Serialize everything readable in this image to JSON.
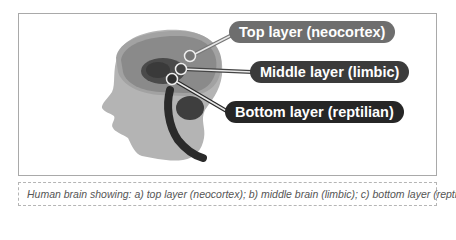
{
  "figure": {
    "labels": {
      "top": "Top layer (neocortex)",
      "middle": "Middle layer (limbic)",
      "bottom": "Bottom layer (reptilian)"
    },
    "caption": "Human brain showing: a) top layer (neocortex); b) middle brain (limbic); c) bottom layer (reptilian).",
    "colors": {
      "head": "#b4b4b4",
      "neocortex": "#8a8a8a",
      "neocortex_rim": "#a8a8a8",
      "limbic": "#4a4a4a",
      "reptilian": "#2a2a2a",
      "label_top": "#6e6e6e",
      "label_middle": "#3b3b3b",
      "label_bottom": "#262626"
    }
  }
}
